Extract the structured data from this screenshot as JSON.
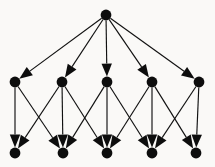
{
  "figure": {
    "name": "directed-layered-graph",
    "background_color": "#faf9f7",
    "node_color": "#0d0d0d",
    "edge_color": "#111111",
    "arrowhead_color": "#0d0d0d",
    "width": 215,
    "height": 167
  },
  "chart_data": {
    "type": "diagram",
    "title": "",
    "layout": "layered directed graph",
    "node_radius": 5.4,
    "arrow_length": 13,
    "arrow_half_width": 5.2,
    "layers": [
      {
        "name": "root",
        "y": 15,
        "node_ids": [
          "R"
        ]
      },
      {
        "name": "middle",
        "y": 82,
        "node_ids": [
          "M1",
          "M2",
          "M3",
          "M4",
          "M5"
        ]
      },
      {
        "name": "bottom",
        "y": 153,
        "node_ids": [
          "B1",
          "B2",
          "B3",
          "B4",
          "B5"
        ]
      }
    ],
    "nodes": [
      {
        "id": "R",
        "label": "",
        "x": 106,
        "y": 15,
        "layer": "root",
        "r": 5.4
      },
      {
        "id": "M1",
        "label": "",
        "x": 15,
        "y": 82,
        "layer": "middle",
        "r": 5.4
      },
      {
        "id": "M2",
        "label": "",
        "x": 62,
        "y": 82,
        "layer": "middle",
        "r": 5.4
      },
      {
        "id": "M3",
        "label": "",
        "x": 107,
        "y": 82,
        "layer": "middle",
        "r": 5.4
      },
      {
        "id": "M4",
        "label": "",
        "x": 152,
        "y": 82,
        "layer": "middle",
        "r": 5.4
      },
      {
        "id": "M5",
        "label": "",
        "x": 199,
        "y": 82,
        "layer": "middle",
        "r": 5.4
      },
      {
        "id": "B1",
        "label": "",
        "x": 15,
        "y": 153,
        "layer": "bottom",
        "r": 5.4
      },
      {
        "id": "B2",
        "label": "",
        "x": 63,
        "y": 153,
        "layer": "bottom",
        "r": 5.4
      },
      {
        "id": "B3",
        "label": "",
        "x": 107,
        "y": 153,
        "layer": "bottom",
        "r": 5.4
      },
      {
        "id": "B4",
        "label": "",
        "x": 152,
        "y": 153,
        "layer": "bottom",
        "r": 5.4
      },
      {
        "id": "B5",
        "label": "",
        "x": 196,
        "y": 153,
        "layer": "bottom",
        "r": 5.4
      }
    ],
    "edges": [
      {
        "from": "R",
        "to": "M1",
        "directed": true
      },
      {
        "from": "R",
        "to": "M2",
        "directed": true
      },
      {
        "from": "R",
        "to": "M3",
        "directed": true
      },
      {
        "from": "R",
        "to": "M4",
        "directed": true
      },
      {
        "from": "R",
        "to": "M5",
        "directed": true
      },
      {
        "from": "M1",
        "to": "B1",
        "directed": true
      },
      {
        "from": "M1",
        "to": "B2",
        "directed": true
      },
      {
        "from": "M2",
        "to": "B1",
        "directed": true
      },
      {
        "from": "M2",
        "to": "B2",
        "directed": true
      },
      {
        "from": "M2",
        "to": "B3",
        "directed": true
      },
      {
        "from": "M3",
        "to": "B2",
        "directed": true
      },
      {
        "from": "M3",
        "to": "B3",
        "directed": true
      },
      {
        "from": "M3",
        "to": "B4",
        "directed": true
      },
      {
        "from": "M4",
        "to": "B3",
        "directed": true
      },
      {
        "from": "M4",
        "to": "B4",
        "directed": true
      },
      {
        "from": "M4",
        "to": "B5",
        "directed": true
      },
      {
        "from": "M5",
        "to": "B4",
        "directed": true
      },
      {
        "from": "M5",
        "to": "B5",
        "directed": true
      }
    ],
    "node_count": 11,
    "edge_count": 18
  }
}
